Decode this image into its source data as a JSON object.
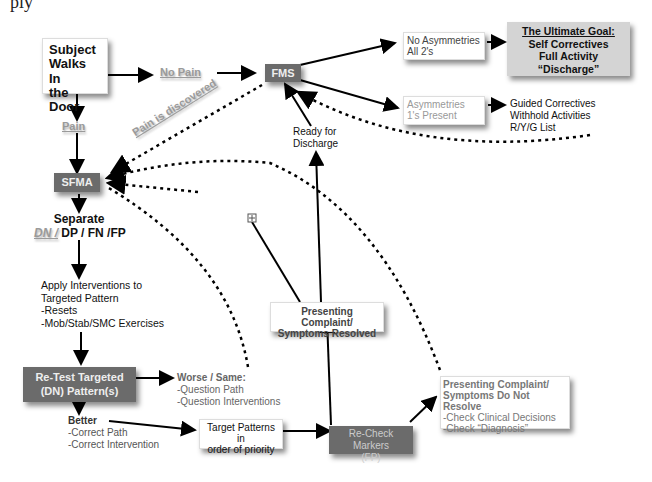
{
  "partial_header_text": "ply",
  "nodes": {
    "start": {
      "lines": [
        "Subject",
        "Walks In",
        "the Door"
      ]
    },
    "no_pain": {
      "label": "No Pain"
    },
    "pain": {
      "label": "Pain"
    },
    "pain_discovered": {
      "label": "Pain is discovered"
    },
    "fms": {
      "label": "FMS"
    },
    "sfma": {
      "label": "SFMA"
    },
    "no_asym": {
      "lines": [
        "No Asymmetries",
        "All 2's"
      ]
    },
    "goal": {
      "title": "The Ultimate Goal:",
      "lines": [
        "Self Correctives",
        "Full Activity",
        "“Discharge”"
      ]
    },
    "asym": {
      "lines": [
        "Asymmetries",
        "1's Present"
      ]
    },
    "guided": {
      "lines": [
        "Guided Correctives",
        "Withhold Activities",
        "R/Y/G List"
      ]
    },
    "ready": {
      "lines": [
        "Ready for",
        "Discharge"
      ]
    },
    "separate": {
      "title": "Separate",
      "dn": "DN /",
      "rest": " DP / FN /FP"
    },
    "apply": {
      "lines": [
        "Apply Interventions to",
        "Targeted Pattern",
        "-Resets",
        "-Mob/Stab/SMC Exercises"
      ]
    },
    "resolved": {
      "lines": [
        "Presenting Complaint/",
        "Symptoms Resolved"
      ]
    },
    "retest": {
      "lines": [
        "Re-Test Targeted",
        "(DN) Pattern(s)"
      ]
    },
    "worse": {
      "title": "Worse / Same:",
      "lines": [
        "-Question Path",
        "-Question Interventions"
      ]
    },
    "better": {
      "title": "Better",
      "lines": [
        "-Correct Path",
        "-Correct Intervention"
      ]
    },
    "target": {
      "lines": [
        "Target Patterns in",
        "order of priority"
      ]
    },
    "recheck": {
      "lines": [
        "Re-Check Markers",
        "(FP)"
      ]
    },
    "not_resolve": {
      "title_lines": [
        "Presenting Complaint/",
        "Symptoms Do Not Resolve"
      ],
      "lines": [
        "-Check Clinical Decisions",
        "-Check “Diagnosis”"
      ]
    }
  },
  "colors": {
    "dark_box": "#6b6b6b",
    "goal_box": "#d4d4d4",
    "grey_text": "#9a9a9a"
  }
}
